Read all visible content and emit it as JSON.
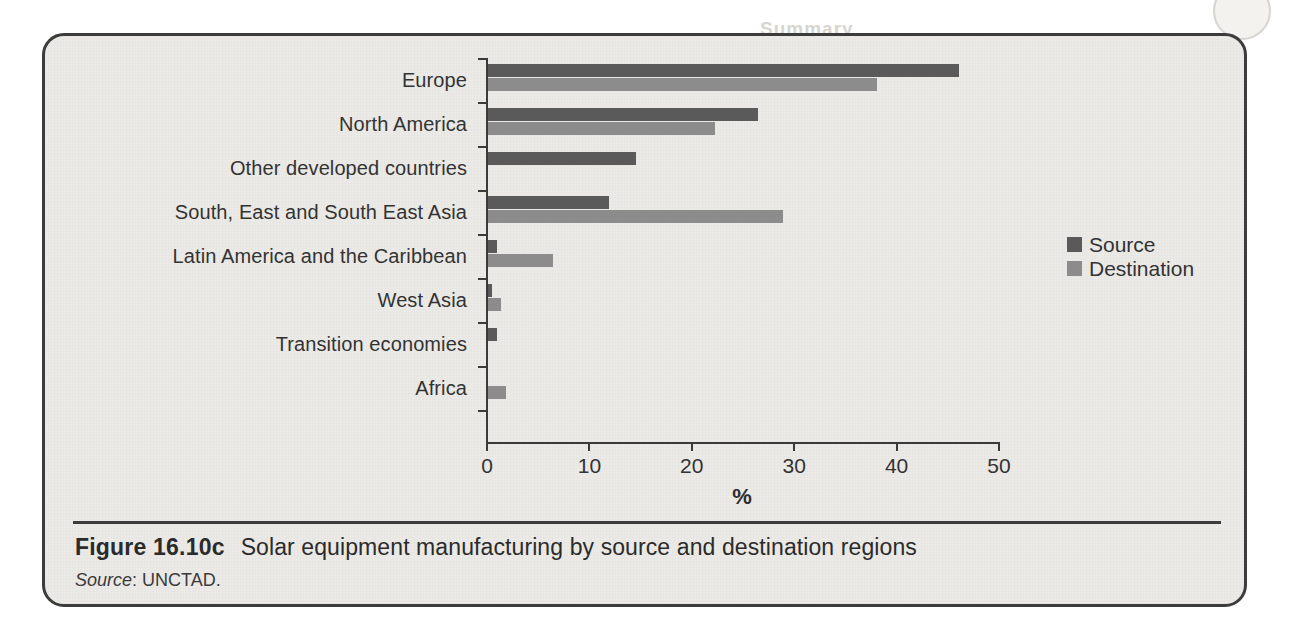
{
  "figure": {
    "number_label": "Figure 16.10c",
    "title": "Solar equipment manufacturing by source and destination regions",
    "source_label": "Source",
    "source_value": ": UNCTAD."
  },
  "legend": {
    "position": "right-middle",
    "entries": [
      {
        "label": "Source",
        "color": "#5a5a5a"
      },
      {
        "label": "Destination",
        "color": "#8c8c8c"
      }
    ]
  },
  "axis": {
    "x_title": "%",
    "x_ticks": [
      "0",
      "10",
      "20",
      "30",
      "40",
      "50"
    ]
  },
  "background_bleed": {
    "heading": "Summary",
    "lines": [
      "the energy sector, for example,",
      "indicators, motivations and",
      "Comparative",
      "dal equipment. Cross-border",
      "ced-country source regions are",
      "arger share of global trade. Wind",
      "d to solar equipment. This clearly",
      "tions of wind turbines are more",
      "wind equipment is more likely to be",
      "ource regions and destinations in",
      "per inefficient trade pattern than",
      "y and economies of scale and to",
      "ment."
    ]
  },
  "chart_data": {
    "type": "bar",
    "orientation": "horizontal",
    "title": "Solar equipment manufacturing by source and destination regions",
    "xlabel": "%",
    "ylabel": "",
    "xlim": [
      0,
      50
    ],
    "xticks": [
      0,
      10,
      20,
      30,
      40,
      50
    ],
    "grid": false,
    "legend_position": "right",
    "categories": [
      "Europe",
      "North America",
      "Other developed countries",
      "South, East and South East Asia",
      "Latin America and the Caribbean",
      "West Asia",
      "Transition economies",
      "Africa"
    ],
    "series": [
      {
        "name": "Source",
        "color": "#5a5a5a",
        "values": [
          46.0,
          26.4,
          14.5,
          11.8,
          0.9,
          0.4,
          0.9,
          0.0
        ]
      },
      {
        "name": "Destination",
        "color": "#8c8c8c",
        "values": [
          38.0,
          22.2,
          0.0,
          28.8,
          6.3,
          1.3,
          0.0,
          1.8
        ]
      }
    ]
  }
}
